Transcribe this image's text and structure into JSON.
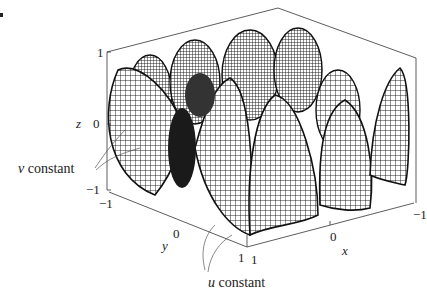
{
  "figure": {
    "type": "3D parametric wireframe surface",
    "stroke_color": "#111111",
    "background": "#ffffff"
  },
  "axes": {
    "z": {
      "label": "z",
      "ticks": [
        "1",
        "0",
        "−1"
      ]
    },
    "y": {
      "label": "y",
      "ticks": [
        "−1",
        "0",
        "1"
      ]
    },
    "x": {
      "label": "x",
      "ticks": [
        "1",
        "0",
        "−1"
      ]
    }
  },
  "annotations": {
    "v_constant": {
      "var": "v",
      "text": " constant"
    },
    "u_constant": {
      "var": "u",
      "text": " constant"
    }
  }
}
